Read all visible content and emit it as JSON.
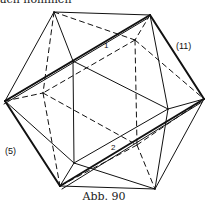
{
  "top_text": "ach nommen",
  "figure": {
    "caption": "Abb. 90",
    "labels": {
      "edge_label_11": "(11)",
      "edge_label_5": "(5)",
      "angle_1": "1",
      "angle_2": "2"
    },
    "vertices": {
      "A": [
        54,
        12
      ],
      "B": [
        150,
        15
      ],
      "C": [
        5,
        101
      ],
      "D": [
        204,
        99
      ],
      "E": [
        60,
        186
      ],
      "F": [
        155,
        189
      ],
      "G": [
        73,
        61
      ],
      "H": [
        168,
        109
      ],
      "I": [
        135,
        40
      ],
      "J": [
        43,
        93
      ],
      "K": [
        74,
        163
      ],
      "L": [
        137,
        145
      ]
    }
  }
}
